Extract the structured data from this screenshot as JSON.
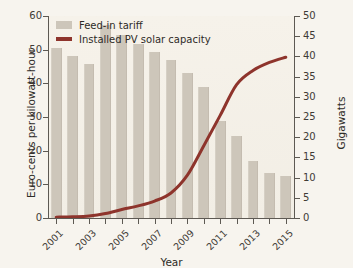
{
  "chart_data": {
    "type": "bar",
    "title": "",
    "xlabel": "Year",
    "ylabel": "Euro-cents per kilowatt-hour",
    "ylabel_right": "Gigawatts",
    "categories": [
      "2001",
      "2002",
      "2003",
      "2004",
      "2005",
      "2006",
      "2007",
      "2008",
      "2009",
      "2010",
      "2011",
      "2012",
      "2013",
      "2014",
      "2015"
    ],
    "xtick_labels": [
      "2001",
      "2003",
      "2005",
      "2007",
      "2009",
      "2011",
      "2013",
      "2015"
    ],
    "ylim": [
      0,
      60
    ],
    "yticks": [
      0,
      10,
      20,
      30,
      40,
      50,
      60
    ],
    "ylim_right": [
      0,
      50
    ],
    "yticks_right": [
      0,
      5,
      10,
      15,
      20,
      25,
      30,
      35,
      40,
      45,
      50
    ],
    "grid": false,
    "legend_position": "upper-left",
    "series": [
      {
        "name": "Feed-in tariff",
        "type": "bar",
        "axis": "left",
        "unit": "Euro-cents per kilowatt-hour",
        "color": "#cdc6ba",
        "values": [
          50.6,
          48.1,
          45.7,
          57.4,
          54.5,
          51.8,
          49.2,
          46.8,
          43.0,
          39.0,
          28.7,
          24.4,
          17.0,
          13.5,
          12.4
        ]
      },
      {
        "name": "Installed PV solar capacity",
        "type": "line",
        "axis": "right",
        "unit": "Gigawatts",
        "color": "#8e342c",
        "values": [
          0.2,
          0.3,
          0.5,
          1.1,
          2.1,
          3.0,
          4.2,
          6.2,
          10.6,
          17.9,
          25.4,
          33.0,
          36.5,
          38.5,
          39.8
        ]
      }
    ]
  },
  "legend": {
    "items": [
      {
        "label": "Feed-in tariff",
        "marker": "bar-swatch",
        "color": "#cdc6ba"
      },
      {
        "label": "Installed PV solar capacity",
        "marker": "line-swatch",
        "color": "#8e342c"
      }
    ]
  },
  "axes": {
    "left_title": "Euro-cents per kilowatt-hour",
    "right_title": "Gigawatts",
    "bottom_title": "Year"
  },
  "colors": {
    "background": "#f7f4ee",
    "plot_background": "#f4f0e8",
    "bar": "#cdc6ba",
    "line": "#8e342c",
    "axis": "#5d5953",
    "text": "#2e2b27"
  }
}
